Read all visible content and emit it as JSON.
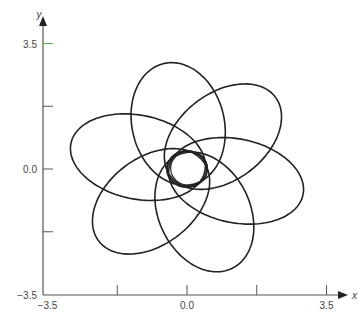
{
  "chart_data": {
    "type": "line",
    "title": "",
    "xlabel": "x",
    "ylabel": "y",
    "xlim": [
      -3.5,
      3.5
    ],
    "ylim": [
      -3.5,
      3.5
    ],
    "grid": false,
    "legend": null,
    "x_ticks": [
      -3.5,
      -1.75,
      0.0,
      1.75,
      3.5
    ],
    "x_tick_labels": [
      "-3.5",
      "",
      "0.0",
      "",
      "3.5"
    ],
    "y_ticks": [
      -3.5,
      -1.75,
      0.0,
      1.75,
      3.5
    ],
    "y_tick_labels": [
      "-3.5",
      "",
      "0.0",
      "",
      "3.5"
    ],
    "series": [
      {
        "name": "orbit",
        "kind": "rosette",
        "petals": 6,
        "perihelion": 0.45,
        "aphelion": 3.0,
        "petal_angles_deg": [
          100,
          45,
          -15,
          -70,
          -135,
          165
        ],
        "inner_circle_radius": 0.5,
        "color": "#222222"
      }
    ],
    "highlight_tick": {
      "axis": "y",
      "value": 3.5,
      "color": "#4caf50"
    }
  }
}
